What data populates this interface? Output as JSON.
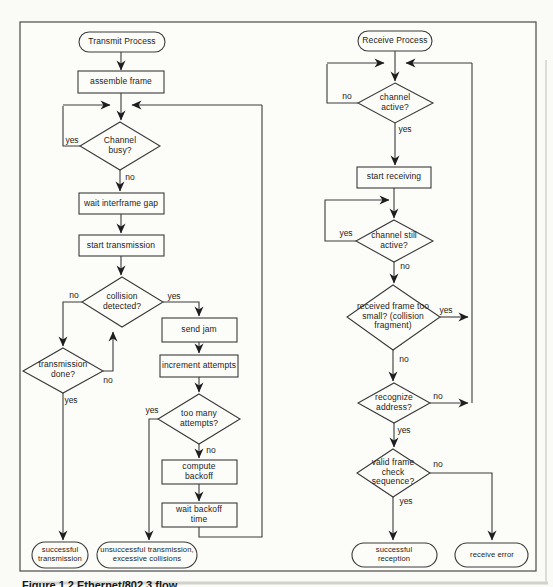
{
  "caption": {
    "text": "Figure 1.2   Ethernet/802.3 flow"
  },
  "diagram": {
    "transmit": {
      "start": "Transmit Process",
      "assemble_frame": "assemble frame",
      "channel_busy": "Channel busy?",
      "channel_busy_yes": "yes",
      "channel_busy_no": "no",
      "wait_interframe_gap": "wait interframe gap",
      "start_transmission": "start transmission",
      "collision_detected": "collision detected?",
      "collision_detected_no": "no",
      "collision_detected_yes": "yes",
      "transmission_done": "transmission done?",
      "transmission_done_no": "no",
      "transmission_done_yes": "yes",
      "send_jam": "send jam",
      "increment_attempts": "increment attempts",
      "too_many_attempts": "too many attempts?",
      "too_many_attempts_yes": "yes",
      "too_many_attempts_no": "no",
      "compute_backoff": "compute backoff",
      "wait_backoff_time": "wait backoff time",
      "successful_transmission": "successful transmission",
      "unsuccessful_transmission": "unsuccessful transmission, excessive collisions"
    },
    "receive": {
      "start": "Receive Process",
      "channel_active": "channel active?",
      "channel_active_no": "no",
      "channel_active_yes": "yes",
      "start_receiving": "start receiving",
      "channel_still_active": "channel still active?",
      "channel_still_active_yes": "yes",
      "channel_still_active_no": "no",
      "frame_too_small": "received frame too small? (collision fragment)",
      "frame_too_small_yes": "yes",
      "frame_too_small_no": "no",
      "recognize_address": "recognize address?",
      "recognize_address_no": "no",
      "recognize_address_yes": "yes",
      "valid_fcs": "valid frame check sequence?",
      "valid_fcs_no": "no",
      "valid_fcs_yes": "yes",
      "successful_reception": "successful reception",
      "receive_error": "receive error"
    }
  }
}
